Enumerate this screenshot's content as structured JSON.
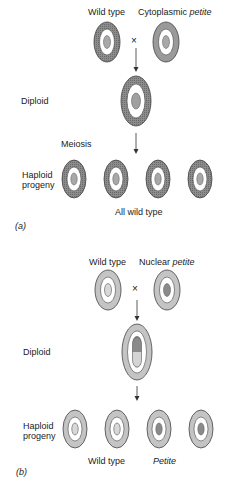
{
  "panel_a": {
    "tag": "(a)",
    "parent1_label": "Wild type",
    "parent2_label_prefix": "Cytoplasmic ",
    "parent2_label_italic": "petite",
    "cross_symbol": "×",
    "diploid_label": "Diploid",
    "meiosis_label": "Meiosis",
    "haploid_label_line1": "Haploid",
    "haploid_label_line2": "progeny",
    "result_label": "All wild type"
  },
  "panel_b": {
    "tag": "(b)",
    "parent1_label": "Wild type",
    "parent2_label_prefix": "Nuclear ",
    "parent2_label_italic": "petite",
    "cross_symbol": "×",
    "diploid_label": "Diploid",
    "haploid_label_line1": "Haploid",
    "haploid_label_line2": "progeny",
    "progeny_label_1": "Wild type",
    "progeny_label_2": "Petite"
  },
  "colors": {
    "cytoplasm_dark": "#7a7a7a",
    "cytoplasm_light": "#bdbdbd",
    "nucleus_wild": "#b5b5b5",
    "nucleus_petite": "#8a8a8a",
    "outline": "#444444"
  }
}
